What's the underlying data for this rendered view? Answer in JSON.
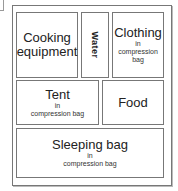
{
  "diagram": {
    "compartments": [
      {
        "id": "cooking",
        "label_line1": "Cooking",
        "label_line2": "equipment"
      },
      {
        "id": "water",
        "label": "Water",
        "orientation": "vertical"
      },
      {
        "id": "clothing",
        "label": "Clothing",
        "note_line1": "in",
        "note_line2": "compression",
        "note_line3": "bag"
      },
      {
        "id": "tent",
        "label": "Tent",
        "note_line1": "in",
        "note_line2": "compression bag"
      },
      {
        "id": "food",
        "label": "Food"
      },
      {
        "id": "sleeping-bag",
        "label": "Sleeping bag",
        "note_line1": "in",
        "note_line2": "compression bag"
      }
    ]
  }
}
